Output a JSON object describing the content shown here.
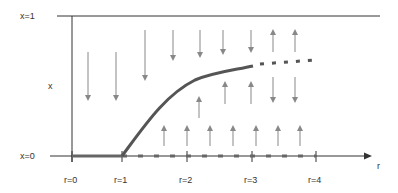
{
  "diagram": {
    "title": "",
    "labels": {
      "x_top": "x=1",
      "x_bottom": "x=0",
      "y_axis": "x",
      "x_axis": "r"
    },
    "r_ticks": [
      "r=0",
      "r=1",
      "r=2",
      "r=3",
      "r=4"
    ],
    "colors": {
      "axis": "#333333",
      "curve": "#555555",
      "arrow": "#888888"
    },
    "elements": {
      "stable_curve": "solid curve from r=1 rising toward x≈0.7 near r=3",
      "unstable_branch": "dashed continuation beyond r=3",
      "x0_stable": "solid on x=0 for 0<r<1",
      "x0_unstable": "dashed on x=0 for r>1",
      "down_arrows": "flow toward x=0 / curve from above",
      "up_arrows": "flow upward toward curve / beyond r=3 toward x=1"
    }
  }
}
